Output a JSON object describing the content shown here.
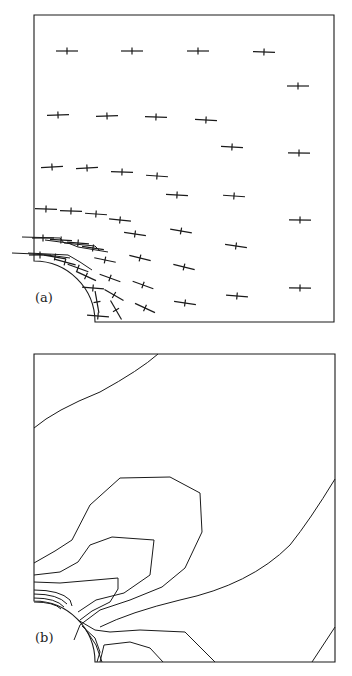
{
  "figure": {
    "panel_a": {
      "label": "(a)",
      "description": "Principal stress direction crosses around quarter circular hole",
      "frame": {
        "x0": 34,
        "y0": 15,
        "x1": 334,
        "y1": 322
      },
      "hole": {
        "cx": 34,
        "cy": 322,
        "r": 61
      },
      "crosses": [
        [
          67,
          51,
          0
        ],
        [
          132,
          51,
          0
        ],
        [
          198,
          51,
          0
        ],
        [
          264,
          52,
          2
        ],
        [
          298,
          86,
          0
        ],
        [
          58,
          115,
          -2
        ],
        [
          107,
          116,
          -2
        ],
        [
          156,
          117,
          2
        ],
        [
          206,
          120,
          3
        ],
        [
          232,
          147,
          3
        ],
        [
          299,
          153,
          1
        ],
        [
          52,
          167,
          -3
        ],
        [
          87,
          168,
          -3
        ],
        [
          122,
          172,
          2
        ],
        [
          157,
          176,
          4
        ],
        [
          177,
          195,
          3
        ],
        [
          234,
          196,
          4
        ],
        [
          46,
          209,
          2
        ],
        [
          71,
          211,
          2
        ],
        [
          96,
          214,
          4
        ],
        [
          120,
          220,
          6
        ],
        [
          300,
          220,
          1
        ],
        [
          135,
          234,
          8
        ],
        [
          181,
          231,
          10
        ],
        [
          43,
          238,
          0
        ],
        [
          61,
          240,
          3
        ],
        [
          78,
          243,
          5
        ],
        [
          93,
          248,
          8
        ],
        [
          236,
          246,
          8
        ],
        [
          40,
          255,
          0
        ],
        [
          55,
          257,
          10
        ],
        [
          65,
          262,
          15
        ],
        [
          78,
          268,
          20
        ],
        [
          86,
          276,
          25
        ],
        [
          105,
          260,
          12
        ],
        [
          140,
          258,
          14
        ],
        [
          184,
          267,
          14
        ],
        [
          110,
          278,
          20
        ],
        [
          143,
          285,
          20
        ],
        [
          93,
          288,
          5
        ],
        [
          97,
          302,
          80
        ],
        [
          98,
          316,
          5
        ],
        [
          114,
          295,
          30
        ],
        [
          116,
          310,
          60
        ],
        [
          145,
          308,
          25
        ],
        [
          185,
          303,
          8
        ],
        [
          237,
          296,
          5
        ],
        [
          300,
          288,
          1
        ]
      ]
    },
    "panel_b": {
      "label": "(b)",
      "description": "Contour lines of stress field around quarter circular hole",
      "frame": {
        "x0": 34,
        "y0": 354,
        "x1": 335,
        "y1": 662
      },
      "hole": {
        "cx": 34,
        "cy": 662,
        "r": 61
      }
    }
  }
}
